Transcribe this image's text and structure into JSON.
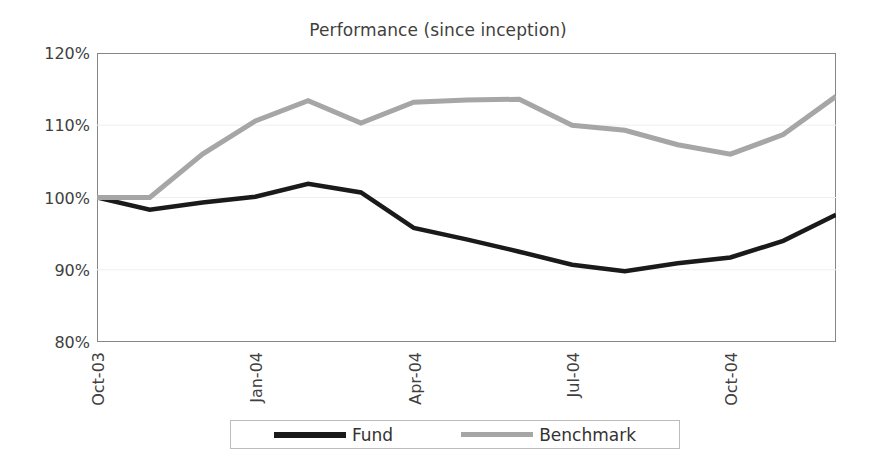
{
  "chart_data": {
    "type": "line",
    "title": "Performance (since inception)",
    "xlabel": "",
    "ylabel": "",
    "ylim": [
      80,
      120
    ],
    "ytick_values": [
      80,
      90,
      100,
      110,
      120
    ],
    "ytick_labels": [
      "80%",
      "90%",
      "100%",
      "110%",
      "120%"
    ],
    "grid": true,
    "legend_position": "bottom",
    "x": [
      "Oct-03",
      "Nov-03",
      "Dec-03",
      "Jan-04",
      "Feb-04",
      "Mar-04",
      "Apr-04",
      "May-04",
      "Jun-04",
      "Jul-04",
      "Aug-04",
      "Sep-04",
      "Oct-04",
      "Nov-04",
      "Dec-04"
    ],
    "xtick_labels": [
      "Oct-03",
      "Jan-04",
      "Apr-04",
      "Jul-04",
      "Oct-04"
    ],
    "xtick_indices": [
      0,
      3,
      6,
      9,
      12
    ],
    "series": [
      {
        "name": "Fund",
        "color": "#1a1a1a",
        "width": 4.5,
        "values": [
          100.0,
          98.3,
          99.3,
          100.1,
          101.9,
          100.7,
          95.8,
          94.2,
          92.5,
          90.7,
          89.8,
          90.9,
          91.7,
          94.0,
          97.6
        ]
      },
      {
        "name": "Benchmark",
        "color": "#a6a6a6",
        "width": 5.0,
        "values": [
          100.0,
          100.0,
          106.0,
          110.6,
          113.4,
          110.3,
          113.2,
          113.5,
          113.6,
          110.0,
          109.3,
          107.3,
          106.0,
          108.7,
          114.0
        ]
      }
    ]
  },
  "legend": {
    "fund_label": "Fund",
    "benchmark_label": "Benchmark"
  },
  "colors": {
    "fund": "#1a1a1a",
    "benchmark": "#a6a6a6",
    "axis": "#868686",
    "grid": "#efefef",
    "text": "#404040",
    "background": "#ffffff"
  }
}
